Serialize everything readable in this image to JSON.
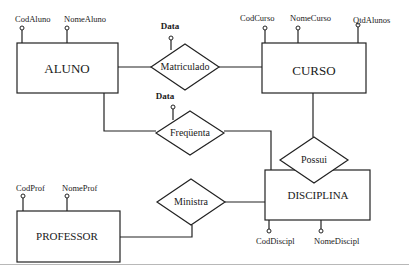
{
  "diagram": {
    "type": "entity-relationship",
    "entities": [
      {
        "id": "aluno",
        "label": "ALUNO",
        "attributes": [
          "CodAluno",
          "NomeAluno"
        ]
      },
      {
        "id": "curso",
        "label": "CURSO",
        "attributes": [
          "CodCurso",
          "NomeCurso",
          "QtdAlunos"
        ]
      },
      {
        "id": "disciplina",
        "label": "DISCIPLINA",
        "attributes": [
          "CodDiscipl",
          "NomeDiscipl"
        ]
      },
      {
        "id": "professor",
        "label": "PROFESSOR",
        "attributes": [
          "CodProf",
          "NomeProf"
        ]
      }
    ],
    "relationships": [
      {
        "id": "matriculado",
        "label": "Matriculado",
        "attribute": "Data",
        "connects": [
          "ALUNO",
          "CURSO"
        ]
      },
      {
        "id": "frequenta",
        "label": "Freqüenta",
        "attribute": "Data",
        "connects": [
          "ALUNO",
          "DISCIPLINA"
        ]
      },
      {
        "id": "possui",
        "label": "Possui",
        "connects": [
          "CURSO",
          "DISCIPLINA"
        ]
      },
      {
        "id": "ministra",
        "label": "Ministra",
        "connects": [
          "PROFESSOR",
          "DISCIPLINA"
        ]
      }
    ]
  },
  "labels": {
    "aluno": "ALUNO",
    "curso": "CURSO",
    "disciplina": "DISCIPLINA",
    "professor": "PROFESSOR",
    "matriculado": "Matriculado",
    "frequenta": "Freqüenta",
    "possui": "Possui",
    "ministra": "Ministra",
    "data1": "Data",
    "data2": "Data",
    "codaluno": "CodAluno",
    "nomealuno": "NomeAluno",
    "codcurso": "CodCurso",
    "nomecurso": "NomeCurso",
    "qtdalunos": "QtdAlunos",
    "codprof": "CodProf",
    "nomeprof": "NomeProf",
    "coddiscipl": "CodDiscipl",
    "nomediscipl": "NomeDiscipl"
  }
}
